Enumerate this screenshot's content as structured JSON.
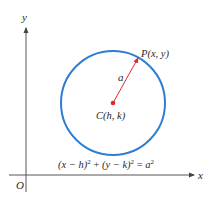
{
  "figure": {
    "axes": {
      "x_label": "x",
      "y_label": "y",
      "origin_label": "O"
    },
    "circle": {
      "center_label": "C(h, k)",
      "point_label": "P(x, y)",
      "radius_label": "a"
    },
    "equation": {
      "lhs_part1": "(x − h)",
      "sq1": "2",
      "plus": " + ",
      "lhs_part2": "(y − k)",
      "sq2": "2",
      "equals": " = ",
      "rhs": "a",
      "sq3": "2"
    },
    "colors": {
      "axis": "#555555",
      "circle": "#2f7dd1",
      "radius": "#e0282e",
      "center_point": "#e0282e",
      "text": "#2a2a2a"
    }
  }
}
